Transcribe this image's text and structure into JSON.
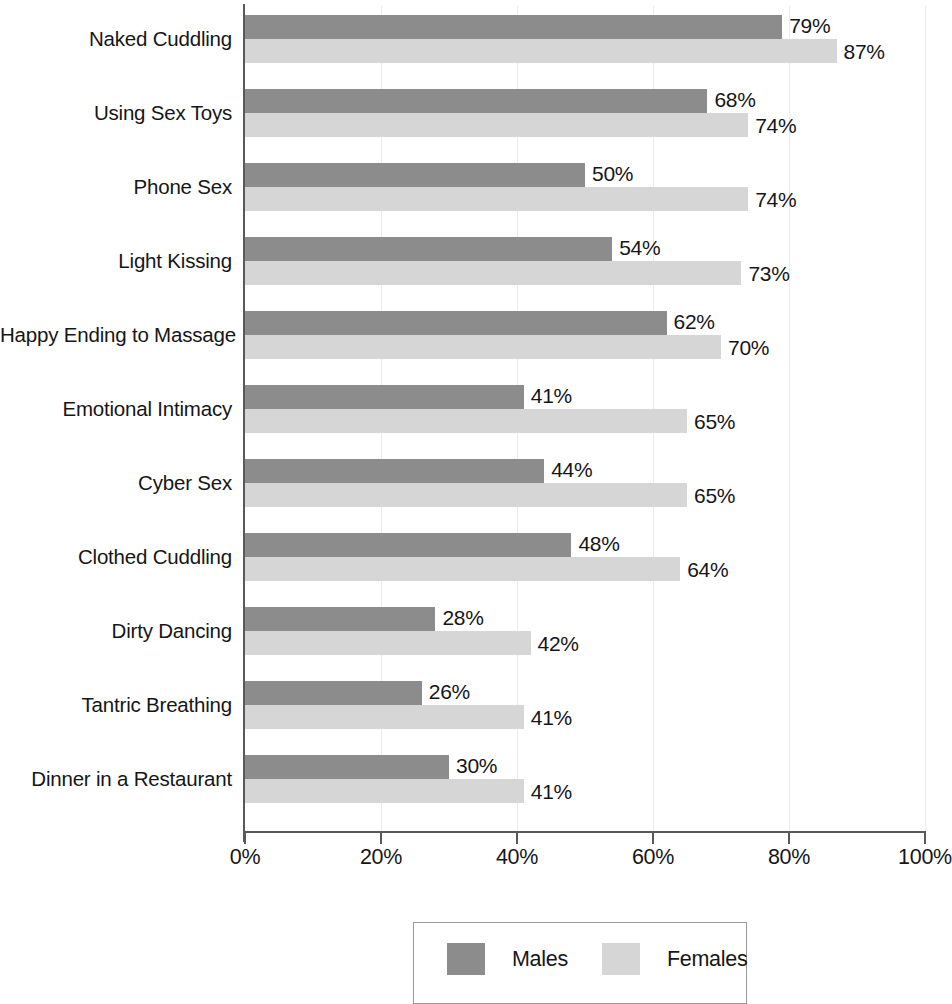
{
  "chart_data": {
    "type": "bar",
    "orientation": "horizontal",
    "title": "",
    "subtitle": "",
    "xlabel": "",
    "ylabel": "",
    "xlim": [
      0,
      100
    ],
    "xticks": [
      "0%",
      "20%",
      "40%",
      "60%",
      "80%",
      "100%"
    ],
    "xtick_values": [
      0,
      20,
      40,
      60,
      80,
      100
    ],
    "grid": true,
    "grid_axis": "x",
    "legend_position": "bottom-center",
    "value_label_suffix": "%",
    "categories": [
      "Naked Cuddling",
      "Using Sex Toys",
      "Phone Sex",
      "Light Kissing",
      "Happy Ending to Massage",
      "Emotional Intimacy",
      "Cyber Sex",
      "Clothed Cuddling",
      "Dirty Dancing",
      "Tantric Breathing",
      "Dinner in a Restaurant"
    ],
    "series": [
      {
        "name": "Males",
        "color": "#8c8c8c",
        "values": [
          79,
          68,
          50,
          54,
          62,
          41,
          44,
          48,
          28,
          26,
          30
        ],
        "labels": [
          "79%",
          "68%",
          "50%",
          "54%",
          "62%",
          "41%",
          "44%",
          "48%",
          "28%",
          "26%",
          "30%"
        ]
      },
      {
        "name": "Females",
        "color": "#d6d6d6",
        "values": [
          87,
          74,
          74,
          73,
          70,
          65,
          65,
          64,
          42,
          41,
          41
        ],
        "labels": [
          "87%",
          "74%",
          "74%",
          "73%",
          "70%",
          "65%",
          "65%",
          "64%",
          "42%",
          "41%",
          "41%"
        ]
      }
    ],
    "legend": [
      {
        "label": "Males",
        "color": "#8c8c8c"
      },
      {
        "label": "Females",
        "color": "#d6d6d6"
      }
    ]
  }
}
